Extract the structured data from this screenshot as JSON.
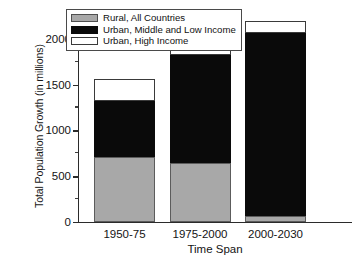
{
  "chart_data": {
    "type": "bar",
    "subtype": "stacked-bar",
    "title": "",
    "xlabel": "Time Span",
    "ylabel": "Total Population Growth (in millions)",
    "categories": [
      "1950-75",
      "1975-2000",
      "2000-2030"
    ],
    "series": [
      {
        "name": "Rural, All Countries",
        "color": "#a8a8a8",
        "values": [
          710,
          640,
          70
        ]
      },
      {
        "name": "Urban, Middle and Low Income",
        "color": "#0a0a0a",
        "values": [
          615,
          1185,
          1990
        ]
      },
      {
        "name": "Urban, High Income",
        "color": "#ffffff",
        "values": [
          237,
          142,
          140
        ]
      }
    ],
    "totals": [
      1562,
      1967,
      2200
    ],
    "ylim": [
      0,
      2250
    ],
    "yticks": [
      0,
      500,
      1000,
      1500,
      2000
    ],
    "ytick_labels": [
      "0",
      "500",
      "1000",
      "1500",
      "2000"
    ],
    "yminor_ticks": [
      250,
      750,
      1250,
      1750,
      2250
    ],
    "grid": false,
    "legend_position": "top-left-inside"
  },
  "legend": {
    "items": [
      {
        "label": "Rural, All Countries",
        "swatch": "rural"
      },
      {
        "label": "Urban, Middle and Low Income",
        "swatch": "urban-ml"
      },
      {
        "label": "Urban, High Income",
        "swatch": "urban-hi"
      }
    ]
  },
  "axes": {
    "y_title": "Total Population Growth (in millions)",
    "x_title": "Time Span"
  }
}
